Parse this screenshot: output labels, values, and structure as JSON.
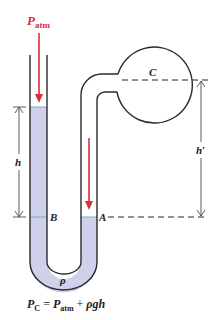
{
  "colors": {
    "fluid": "#cfd0ea",
    "fluid_surface": "#7fa8d8",
    "tube_wall": "#2a2a2a",
    "arrow_red": "#d8303a",
    "dash": "#222222"
  },
  "labels": {
    "p_atm_main": "P",
    "p_atm_sub": "atm",
    "bulb": "C",
    "h": "h",
    "h_prime": "h′",
    "point_b": "B",
    "point_a": "A",
    "density": "ρ"
  },
  "formula": {
    "lhs_main": "P",
    "lhs_sub": "C",
    "equals": " = ",
    "term1_main": "P",
    "term1_sub": "atm",
    "plus": " + ",
    "term2": "ρgh"
  }
}
